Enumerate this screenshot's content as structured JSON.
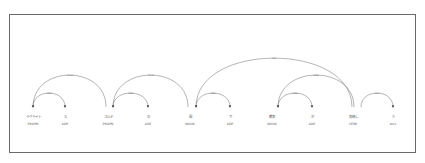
{
  "diagram": {
    "type": "dependency-parse",
    "tokens": [
      {
        "text": "ラグライト",
        "tag": "PROPN",
        "x": 33
      },
      {
        "text": "と",
        "tag": "ADP",
        "x": 65
      },
      {
        "text": "コルテ",
        "tag": "PROPN",
        "x": 108
      },
      {
        "text": "の",
        "tag": "ADP",
        "x": 148
      },
      {
        "text": "間",
        "tag": "NOUN",
        "x": 190
      },
      {
        "text": "で",
        "tag": "ADP",
        "x": 230
      },
      {
        "text": "戦争",
        "tag": "NOUN",
        "x": 272
      },
      {
        "text": "が",
        "tag": "ADP",
        "x": 312
      },
      {
        "text": "勃発し",
        "tag": "VERB",
        "x": 353
      },
      {
        "text": "た",
        "tag": "AUX",
        "x": 393
      }
    ],
    "arcs": [
      {
        "label": "case",
        "from": 33,
        "to": 65,
        "peak": 93,
        "arrow": "to"
      },
      {
        "label": "nmod",
        "from": 33,
        "to": 106,
        "peak": 75,
        "arrow": "from"
      },
      {
        "label": "case",
        "from": 113,
        "to": 148,
        "peak": 93,
        "arrow": "to"
      },
      {
        "label": "nmod",
        "from": 113,
        "to": 188,
        "peak": 75,
        "arrow": "from"
      },
      {
        "label": "case",
        "from": 196,
        "to": 230,
        "peak": 93,
        "arrow": "to"
      },
      {
        "label": "obl",
        "from": 196,
        "to": 352,
        "peak": 58,
        "arrow": "from"
      },
      {
        "label": "case",
        "from": 278,
        "to": 312,
        "peak": 93,
        "arrow": "to"
      },
      {
        "label": "nsubj",
        "from": 278,
        "to": 354,
        "peak": 75,
        "arrow": "from"
      },
      {
        "label": "aux",
        "from": 361,
        "to": 393,
        "peak": 93,
        "arrow": "to"
      }
    ]
  }
}
